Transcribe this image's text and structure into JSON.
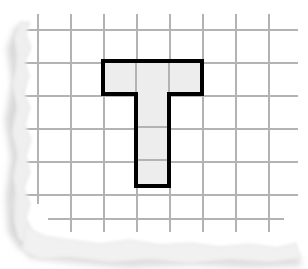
{
  "colors": {
    "paper": "#ffffff",
    "grid_line": "#b3b3b3",
    "shape_outline": "#000000",
    "shape_fill": "#ededed",
    "shadow": "#d9d9d9",
    "torn_edge": "#e8e8e8"
  },
  "grid": {
    "origin_x": 38,
    "origin_y": 30,
    "cell_size": 33,
    "columns": 8,
    "rows": 6,
    "line_width": 1.4,
    "vertical_line_x": [
      38,
      71,
      104,
      137,
      170,
      203,
      236,
      269
    ],
    "horizontal_line_y": [
      30,
      63,
      96,
      129,
      162,
      195,
      219
    ]
  },
  "shape": {
    "name": "t-shape",
    "type": "polygon",
    "cell_count": 6,
    "stroke_width": 4,
    "grid_cells": [
      {
        "col": 2,
        "row": 1
      },
      {
        "col": 3,
        "row": 1
      },
      {
        "col": 4,
        "row": 1
      },
      {
        "col": 3,
        "row": 2
      },
      {
        "col": 3,
        "row": 3
      },
      {
        "col": 3,
        "row": 4
      }
    ],
    "outline_points": "103,61 202,61 202,94 169,94 169,186 136,186 136,94 103,94",
    "interior_segments": [
      {
        "x1": 136,
        "y1": 61,
        "x2": 136,
        "y2": 94
      },
      {
        "x1": 169,
        "y1": 61,
        "x2": 169,
        "y2": 94
      },
      {
        "x1": 136,
        "y1": 127,
        "x2": 169,
        "y2": 127
      },
      {
        "x1": 136,
        "y1": 160,
        "x2": 169,
        "y2": 160
      }
    ],
    "bar": {
      "left": 103,
      "top": 61,
      "right": 202,
      "bottom": 94
    },
    "stem": {
      "left": 136,
      "top": 94,
      "right": 169,
      "bottom": 186
    }
  },
  "paper": {
    "left_torn_edge_path": "M 30 22 L 26 34 L 31 48 L 25 62 L 29 76 L 24 92 L 30 108 L 25 124 L 31 140 L 26 156 L 30 172 L 24 188 L 30 204 L 26 218 L 33 232 L 40 244 L 30 248 L 18 238 L 14 220 L 17 198 L 13 176 L 18 154 L 12 132 L 17 108 L 12 84 L 18 60 L 14 38 L 20 22 Z",
    "bottom_torn_edge_path": "M 26 226 L 44 236 L 70 240 L 100 244 L 130 240 L 160 245 L 190 243 L 220 247 L 250 244 L 276 248 L 296 243 L 300 258 L 270 262 L 230 259 L 190 263 L 150 259 L 110 262 L 70 257 L 40 259 L 22 250 Z"
  }
}
